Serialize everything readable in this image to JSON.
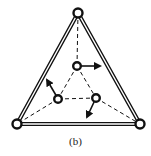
{
  "diagram": {
    "caption": "(b)",
    "colors": {
      "stroke": "#111111",
      "background": "#ffffff"
    },
    "outer_nodes": [
      {
        "id": "top",
        "x": 78,
        "y": 13
      },
      {
        "id": "bottom-left",
        "x": 17,
        "y": 124
      },
      {
        "id": "bottom-right",
        "x": 140,
        "y": 124
      }
    ],
    "inner_nodes": [
      {
        "id": "inner-top",
        "x": 77,
        "y": 66
      },
      {
        "id": "inner-left",
        "x": 58,
        "y": 99
      },
      {
        "id": "inner-right",
        "x": 96,
        "y": 98
      }
    ],
    "outer_edges_style": "double-line",
    "inner_edges_style": "dashed",
    "arrows": [
      {
        "from": "inner-top",
        "dx": 24,
        "dy": 0
      },
      {
        "from": "inner-left",
        "dx": -12,
        "dy": -20
      },
      {
        "from": "inner-right",
        "dx": -10,
        "dy": 20
      }
    ]
  }
}
